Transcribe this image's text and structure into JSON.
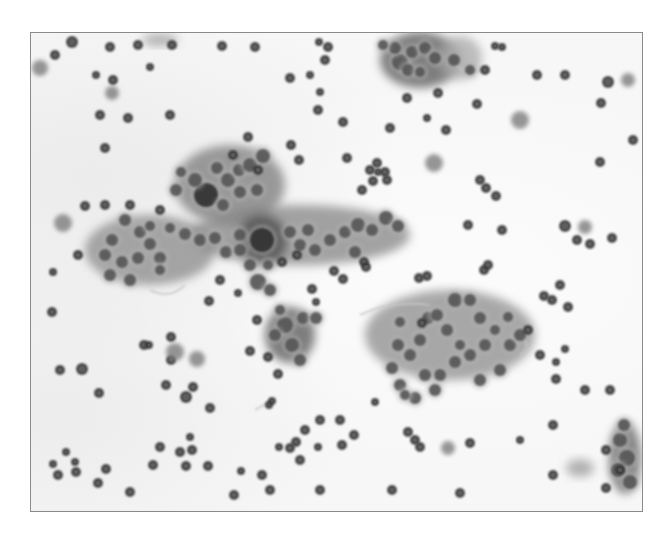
{
  "image": {
    "type": "grayscale cytology micrograph",
    "width": 669,
    "height": 535,
    "background_color": "#ffffff",
    "frame": {
      "x": 30,
      "y": 32,
      "w": 613,
      "h": 480,
      "border_color": "#8a8a8a",
      "fill_color": "#f7f7f7"
    }
  },
  "colors": {
    "nucleus_dark": "#3a3a3a",
    "nucleus_mid": "#555555",
    "cytoplasm": "#8c8c8c",
    "cytoplasm_light": "#b4b4b4",
    "fibrin": "#c8c8c8"
  },
  "clusters": [
    {
      "name": "upper-left-cluster",
      "cx": 230,
      "cy": 185,
      "rx": 55,
      "ry": 40,
      "shade": "#7a7a7a"
    },
    {
      "name": "left-sheet",
      "cx": 150,
      "cy": 250,
      "rx": 65,
      "ry": 35,
      "shade": "#8a8a8a"
    },
    {
      "name": "central-band",
      "cx": 300,
      "cy": 235,
      "rx": 110,
      "ry": 30,
      "shade": "#858585"
    },
    {
      "name": "center-dense",
      "cx": 262,
      "cy": 240,
      "rx": 25,
      "ry": 25,
      "shade": "#4a4a4a"
    },
    {
      "name": "lower-central-left",
      "cx": 290,
      "cy": 335,
      "rx": 25,
      "ry": 28,
      "shade": "#555555"
    },
    {
      "name": "lower-right-sheet",
      "cx": 450,
      "cy": 335,
      "rx": 85,
      "ry": 45,
      "shade": "#8c8c8c"
    },
    {
      "name": "top-cluster",
      "cx": 420,
      "cy": 60,
      "rx": 40,
      "ry": 28,
      "shade": "#555555"
    },
    {
      "name": "top-cluster-pale",
      "cx": 460,
      "cy": 58,
      "rx": 22,
      "ry": 22,
      "shade": "#a8a8a8"
    },
    {
      "name": "bottom-right-cluster",
      "cx": 625,
      "cy": 458,
      "rx": 16,
      "ry": 36,
      "shade": "#5e5e5e"
    },
    {
      "name": "bottom-right-pale",
      "cx": 580,
      "cy": 468,
      "rx": 14,
      "ry": 9,
      "shade": "#9a9a9a"
    },
    {
      "name": "top-left-streak",
      "cx": 160,
      "cy": 40,
      "rx": 18,
      "ry": 6,
      "shade": "#9a9a9a"
    }
  ],
  "cells": [
    [
      72,
      42,
      6
    ],
    [
      110,
      47,
      5
    ],
    [
      138,
      45,
      5
    ],
    [
      172,
      45,
      5
    ],
    [
      40,
      68,
      8
    ],
    [
      55,
      55,
      5
    ],
    [
      96,
      75,
      4
    ],
    [
      112,
      93,
      7
    ],
    [
      113,
      80,
      5
    ],
    [
      150,
      67,
      4
    ],
    [
      100,
      115,
      5
    ],
    [
      128,
      118,
      5
    ],
    [
      105,
      148,
      5
    ],
    [
      170,
      115,
      5
    ],
    [
      222,
      46,
      5
    ],
    [
      255,
      47,
      5
    ],
    [
      328,
      47,
      5
    ],
    [
      325,
      60,
      5
    ],
    [
      319,
      42,
      4
    ],
    [
      310,
      75,
      4
    ],
    [
      290,
      78,
      5
    ],
    [
      318,
      110,
      5
    ],
    [
      343,
      122,
      5
    ],
    [
      347,
      158,
      5
    ],
    [
      320,
      92,
      4
    ],
    [
      390,
      128,
      5
    ],
    [
      407,
      98,
      5
    ],
    [
      446,
      130,
      5
    ],
    [
      438,
      93,
      5
    ],
    [
      427,
      118,
      4
    ],
    [
      485,
      70,
      5
    ],
    [
      495,
      46,
      4
    ],
    [
      502,
      47,
      4
    ],
    [
      537,
      75,
      5
    ],
    [
      565,
      75,
      5
    ],
    [
      601,
      103,
      5
    ],
    [
      608,
      82,
      6
    ],
    [
      628,
      80,
      7
    ],
    [
      633,
      140,
      5
    ],
    [
      520,
      120,
      9
    ],
    [
      434,
      163,
      9
    ],
    [
      477,
      104,
      5
    ],
    [
      480,
      180,
      5
    ],
    [
      600,
      162,
      5
    ],
    [
      585,
      227,
      7
    ],
    [
      577,
      240,
      5
    ],
    [
      590,
      244,
      5
    ],
    [
      612,
      238,
      5
    ],
    [
      486,
      188,
      5
    ],
    [
      496,
      196,
      5
    ],
    [
      468,
      225,
      5
    ],
    [
      502,
      230,
      5
    ],
    [
      565,
      226,
      6
    ],
    [
      560,
      285,
      5
    ],
    [
      552,
      300,
      5
    ],
    [
      540,
      355,
      5
    ],
    [
      556,
      379,
      5
    ],
    [
      585,
      390,
      5
    ],
    [
      610,
      390,
      5
    ],
    [
      606,
      450,
      5
    ],
    [
      620,
      470,
      5
    ],
    [
      606,
      488,
      5
    ],
    [
      553,
      475,
      5
    ],
    [
      553,
      425,
      5
    ],
    [
      520,
      440,
      4
    ],
    [
      470,
      443,
      5
    ],
    [
      448,
      448,
      7
    ],
    [
      415,
      440,
      5
    ],
    [
      420,
      447,
      5
    ],
    [
      375,
      402,
      4
    ],
    [
      354,
      435,
      5
    ],
    [
      340,
      420,
      5
    ],
    [
      320,
      420,
      5
    ],
    [
      342,
      445,
      5
    ],
    [
      305,
      430,
      5
    ],
    [
      318,
      447,
      4
    ],
    [
      296,
      442,
      5
    ],
    [
      300,
      460,
      5
    ],
    [
      290,
      448,
      5
    ],
    [
      272,
      401,
      4
    ],
    [
      269,
      405,
      4
    ],
    [
      262,
      475,
      5
    ],
    [
      234,
      495,
      5
    ],
    [
      208,
      466,
      5
    ],
    [
      180,
      452,
      5
    ],
    [
      186,
      466,
      5
    ],
    [
      153,
      465,
      5
    ],
    [
      160,
      447,
      5
    ],
    [
      130,
      492,
      5
    ],
    [
      106,
      469,
      5
    ],
    [
      98,
      483,
      5
    ],
    [
      76,
      472,
      5
    ],
    [
      75,
      462,
      4
    ],
    [
      66,
      452,
      4
    ],
    [
      58,
      475,
      5
    ],
    [
      53,
      464,
      4
    ],
    [
      52,
      312,
      5
    ],
    [
      60,
      370,
      5
    ],
    [
      82,
      369,
      6
    ],
    [
      99,
      393,
      5
    ],
    [
      144,
      345,
      5
    ],
    [
      149,
      345,
      4
    ],
    [
      171,
      360,
      5
    ],
    [
      166,
      385,
      5
    ],
    [
      193,
      387,
      5
    ],
    [
      186,
      397,
      6
    ],
    [
      197,
      359,
      8
    ],
    [
      171,
      337,
      5
    ],
    [
      175,
      352,
      9
    ],
    [
      210,
      408,
      5
    ],
    [
      192,
      450,
      5
    ],
    [
      190,
      437,
      4
    ],
    [
      241,
      471,
      4
    ],
    [
      63,
      223,
      9
    ],
    [
      78,
      255,
      5
    ],
    [
      53,
      272,
      4
    ],
    [
      85,
      206,
      5
    ],
    [
      105,
      205,
      5
    ],
    [
      130,
      205,
      5
    ],
    [
      160,
      210,
      5
    ],
    [
      209,
      301,
      5
    ],
    [
      238,
      293,
      4
    ],
    [
      250,
      351,
      5
    ],
    [
      268,
      357,
      5
    ],
    [
      278,
      374,
      5
    ],
    [
      257,
      320,
      5
    ],
    [
      220,
      280,
      5
    ],
    [
      370,
      170,
      5
    ],
    [
      373,
      181,
      5
    ],
    [
      385,
      172,
      5
    ],
    [
      387,
      180,
      5
    ],
    [
      377,
      163,
      5
    ],
    [
      378,
      172,
      4
    ],
    [
      362,
      190,
      5
    ],
    [
      248,
      137,
      5
    ],
    [
      233,
      155,
      5
    ],
    [
      258,
      170,
      5
    ],
    [
      291,
      145,
      5
    ],
    [
      299,
      160,
      5
    ],
    [
      364,
      262,
      5
    ],
    [
      366,
      267,
      5
    ],
    [
      419,
      278,
      5
    ],
    [
      427,
      276,
      5
    ],
    [
      422,
      323,
      5
    ],
    [
      484,
      270,
      5
    ],
    [
      488,
      265,
      5
    ],
    [
      544,
      296,
      5
    ],
    [
      528,
      330,
      5
    ],
    [
      568,
      307,
      5
    ],
    [
      565,
      349,
      4
    ],
    [
      556,
      362,
      4
    ],
    [
      312,
      289,
      5
    ],
    [
      334,
      271,
      5
    ],
    [
      343,
      279,
      5
    ],
    [
      316,
      302,
      4
    ],
    [
      282,
      262,
      5
    ],
    [
      297,
      255,
      5
    ],
    [
      279,
      447,
      4
    ],
    [
      270,
      490,
      5
    ],
    [
      320,
      490,
      5
    ],
    [
      392,
      490,
      5
    ],
    [
      460,
      493,
      5
    ],
    [
      408,
      432,
      5
    ]
  ],
  "cluster_nuclei": [
    [
      206,
      195,
      12
    ],
    [
      195,
      180,
      7
    ],
    [
      217,
      168,
      6
    ],
    [
      228,
      180,
      7
    ],
    [
      239,
      170,
      6
    ],
    [
      250,
      165,
      7
    ],
    [
      263,
      156,
      7
    ],
    [
      240,
      192,
      6
    ],
    [
      257,
      190,
      6
    ],
    [
      223,
      205,
      6
    ],
    [
      181,
      172,
      5
    ],
    [
      176,
      190,
      6
    ],
    [
      140,
      232,
      6
    ],
    [
      125,
      220,
      6
    ],
    [
      112,
      240,
      6
    ],
    [
      105,
      255,
      6
    ],
    [
      122,
      262,
      6
    ],
    [
      138,
      258,
      6
    ],
    [
      150,
      244,
      6
    ],
    [
      160,
      258,
      6
    ],
    [
      160,
      270,
      5
    ],
    [
      130,
      280,
      6
    ],
    [
      110,
      275,
      6
    ],
    [
      150,
      226,
      5
    ],
    [
      170,
      228,
      5
    ],
    [
      185,
      234,
      6
    ],
    [
      200,
      240,
      6
    ],
    [
      215,
      238,
      6
    ],
    [
      226,
      252,
      6
    ],
    [
      240,
      235,
      6
    ],
    [
      240,
      250,
      6
    ],
    [
      262,
      240,
      12
    ],
    [
      250,
      265,
      6
    ],
    [
      258,
      282,
      8
    ],
    [
      270,
      290,
      6
    ],
    [
      268,
      265,
      5
    ],
    [
      290,
      232,
      6
    ],
    [
      308,
      230,
      6
    ],
    [
      300,
      245,
      6
    ],
    [
      315,
      250,
      6
    ],
    [
      330,
      240,
      6
    ],
    [
      345,
      232,
      6
    ],
    [
      358,
      225,
      7
    ],
    [
      372,
      230,
      6
    ],
    [
      386,
      218,
      7
    ],
    [
      398,
      226,
      6
    ],
    [
      355,
      252,
      6
    ],
    [
      285,
      325,
      8
    ],
    [
      275,
      335,
      6
    ],
    [
      292,
      345,
      7
    ],
    [
      300,
      360,
      6
    ],
    [
      280,
      310,
      5
    ],
    [
      303,
      318,
      6
    ],
    [
      316,
      318,
      6
    ],
    [
      400,
      322,
      5
    ],
    [
      420,
      340,
      6
    ],
    [
      428,
      318,
      6
    ],
    [
      437,
      315,
      6
    ],
    [
      447,
      330,
      6
    ],
    [
      455,
      300,
      7
    ],
    [
      470,
      300,
      6
    ],
    [
      480,
      318,
      6
    ],
    [
      485,
      345,
      6
    ],
    [
      470,
      355,
      6
    ],
    [
      455,
      362,
      6
    ],
    [
      440,
      375,
      6
    ],
    [
      425,
      375,
      6
    ],
    [
      410,
      355,
      6
    ],
    [
      398,
      345,
      6
    ],
    [
      392,
      368,
      6
    ],
    [
      400,
      385,
      6
    ],
    [
      415,
      398,
      6
    ],
    [
      435,
      390,
      6
    ],
    [
      480,
      380,
      6
    ],
    [
      500,
      370,
      6
    ],
    [
      510,
      345,
      6
    ],
    [
      520,
      335,
      6
    ],
    [
      460,
      345,
      5
    ],
    [
      495,
      330,
      5
    ],
    [
      508,
      317,
      5
    ],
    [
      405,
      395,
      5
    ],
    [
      400,
      62,
      8
    ],
    [
      412,
      52,
      6
    ],
    [
      425,
      48,
      6
    ],
    [
      395,
      48,
      6
    ],
    [
      408,
      70,
      6
    ],
    [
      420,
      72,
      5
    ],
    [
      435,
      58,
      6
    ],
    [
      383,
      45,
      5
    ],
    [
      454,
      60,
      6
    ],
    [
      470,
      70,
      5
    ],
    [
      620,
      440,
      7
    ],
    [
      627,
      458,
      8
    ],
    [
      618,
      470,
      7
    ],
    [
      630,
      482,
      7
    ],
    [
      624,
      425,
      6
    ]
  ],
  "fibrin_strands": [
    "M 150 290 Q 170 300 185 285",
    "M 360 315 Q 390 300 430 305",
    "M 455 65 Q 470 75 480 70",
    "M 520 355 Q 530 350 525 340",
    "M 255 410 Q 265 405 270 400"
  ]
}
